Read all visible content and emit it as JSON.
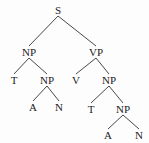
{
  "diagram": {
    "type": "parse-tree",
    "nodes": [
      {
        "id": "n0",
        "label": "S",
        "x": 58,
        "y": 10
      },
      {
        "id": "n1",
        "label": "NP",
        "x": 29,
        "y": 52
      },
      {
        "id": "n2",
        "label": "VP",
        "x": 96,
        "y": 52
      },
      {
        "id": "n3",
        "label": "T",
        "x": 14,
        "y": 80
      },
      {
        "id": "n4",
        "label": "NP",
        "x": 47,
        "y": 80
      },
      {
        "id": "n5",
        "label": "V",
        "x": 76,
        "y": 80
      },
      {
        "id": "n6",
        "label": "NP",
        "x": 109,
        "y": 80
      },
      {
        "id": "n7",
        "label": "A",
        "x": 33,
        "y": 107
      },
      {
        "id": "n8",
        "label": "N",
        "x": 59,
        "y": 107
      },
      {
        "id": "n9",
        "label": "T",
        "x": 91,
        "y": 109
      },
      {
        "id": "n10",
        "label": "NP",
        "x": 123,
        "y": 109
      },
      {
        "id": "n11",
        "label": "A",
        "x": 108,
        "y": 135
      },
      {
        "id": "n12",
        "label": "N",
        "x": 139,
        "y": 135
      }
    ],
    "edges": [
      [
        "n0",
        "n1"
      ],
      [
        "n0",
        "n2"
      ],
      [
        "n1",
        "n3"
      ],
      [
        "n1",
        "n4"
      ],
      [
        "n4",
        "n7"
      ],
      [
        "n4",
        "n8"
      ],
      [
        "n2",
        "n5"
      ],
      [
        "n2",
        "n6"
      ],
      [
        "n6",
        "n9"
      ],
      [
        "n6",
        "n10"
      ],
      [
        "n10",
        "n11"
      ],
      [
        "n10",
        "n12"
      ]
    ]
  }
}
